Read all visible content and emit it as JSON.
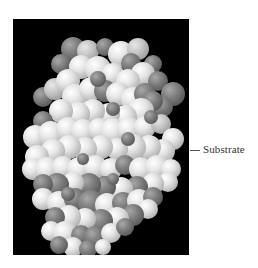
{
  "figure": {
    "label": "Substrate",
    "background": "#000000",
    "light_atom_color": "#e6e6e6",
    "dark_atom_color": "#6e6e6e"
  },
  "atoms": [
    [
      60,
      30,
      12,
      "d"
    ],
    [
      75,
      32,
      11,
      "m"
    ],
    [
      92,
      28,
      9,
      "d"
    ],
    [
      108,
      35,
      13,
      "l"
    ],
    [
      125,
      30,
      11,
      "m"
    ],
    [
      118,
      44,
      10,
      "d"
    ],
    [
      140,
      45,
      9,
      "d"
    ],
    [
      130,
      55,
      12,
      "l"
    ],
    [
      48,
      45,
      10,
      "d"
    ],
    [
      68,
      48,
      12,
      "l"
    ],
    [
      85,
      50,
      13,
      "l"
    ],
    [
      100,
      55,
      11,
      "l"
    ],
    [
      115,
      62,
      12,
      "l"
    ],
    [
      145,
      62,
      10,
      "d"
    ],
    [
      160,
      75,
      12,
      "d"
    ],
    [
      150,
      88,
      10,
      "d"
    ],
    [
      30,
      78,
      10,
      "d"
    ],
    [
      42,
      70,
      11,
      "m"
    ],
    [
      55,
      62,
      12,
      "l"
    ],
    [
      62,
      78,
      13,
      "l"
    ],
    [
      78,
      70,
      12,
      "l"
    ],
    [
      92,
      72,
      11,
      "d"
    ],
    [
      105,
      75,
      12,
      "l"
    ],
    [
      120,
      80,
      12,
      "l"
    ],
    [
      132,
      75,
      11,
      "d"
    ],
    [
      140,
      82,
      10,
      "d"
    ],
    [
      128,
      92,
      13,
      "l"
    ],
    [
      112,
      98,
      12,
      "l"
    ],
    [
      96,
      95,
      11,
      "l"
    ],
    [
      80,
      92,
      12,
      "l"
    ],
    [
      65,
      95,
      12,
      "l"
    ],
    [
      48,
      92,
      12,
      "l"
    ],
    [
      30,
      102,
      10,
      "d"
    ],
    [
      22,
      118,
      12,
      "l"
    ],
    [
      38,
      115,
      13,
      "l"
    ],
    [
      55,
      110,
      12,
      "l"
    ],
    [
      70,
      112,
      12,
      "l"
    ],
    [
      86,
      110,
      11,
      "l"
    ],
    [
      100,
      112,
      13,
      "l"
    ],
    [
      116,
      110,
      12,
      "l"
    ],
    [
      132,
      108,
      11,
      "l"
    ],
    [
      148,
      105,
      10,
      "m"
    ],
    [
      160,
      120,
      11,
      "l"
    ],
    [
      150,
      132,
      12,
      "l"
    ],
    [
      136,
      128,
      12,
      "l"
    ],
    [
      120,
      128,
      13,
      "l"
    ],
    [
      104,
      130,
      11,
      "l"
    ],
    [
      88,
      128,
      12,
      "l"
    ],
    [
      72,
      130,
      12,
      "l"
    ],
    [
      56,
      128,
      12,
      "l"
    ],
    [
      40,
      132,
      12,
      "l"
    ],
    [
      24,
      138,
      12,
      "l"
    ],
    [
      20,
      150,
      11,
      "l"
    ],
    [
      34,
      150,
      12,
      "l"
    ],
    [
      50,
      148,
      11,
      "l"
    ],
    [
      66,
      150,
      12,
      "l"
    ],
    [
      82,
      148,
      12,
      "l"
    ],
    [
      98,
      150,
      11,
      "l"
    ],
    [
      112,
      146,
      10,
      "d"
    ],
    [
      128,
      150,
      12,
      "l"
    ],
    [
      144,
      148,
      12,
      "l"
    ],
    [
      158,
      150,
      10,
      "l"
    ],
    [
      155,
      163,
      10,
      "l"
    ],
    [
      140,
      165,
      11,
      "l"
    ],
    [
      124,
      168,
      11,
      "d"
    ],
    [
      108,
      170,
      12,
      "l"
    ],
    [
      92,
      168,
      11,
      "d"
    ],
    [
      76,
      166,
      12,
      "d"
    ],
    [
      60,
      164,
      11,
      "l"
    ],
    [
      44,
      166,
      12,
      "d"
    ],
    [
      30,
      165,
      10,
      "d"
    ],
    [
      30,
      180,
      11,
      "l"
    ],
    [
      46,
      184,
      12,
      "l"
    ],
    [
      62,
      180,
      11,
      "d"
    ],
    [
      78,
      184,
      13,
      "d"
    ],
    [
      94,
      186,
      12,
      "l"
    ],
    [
      110,
      184,
      11,
      "d"
    ],
    [
      126,
      182,
      12,
      "l"
    ],
    [
      140,
      178,
      10,
      "d"
    ],
    [
      135,
      190,
      10,
      "l"
    ],
    [
      120,
      196,
      11,
      "d"
    ],
    [
      104,
      200,
      12,
      "l"
    ],
    [
      88,
      202,
      12,
      "d"
    ],
    [
      72,
      200,
      11,
      "l"
    ],
    [
      56,
      198,
      12,
      "l"
    ],
    [
      42,
      198,
      10,
      "d"
    ],
    [
      38,
      212,
      10,
      "l"
    ],
    [
      52,
      214,
      12,
      "l"
    ],
    [
      68,
      216,
      10,
      "d"
    ],
    [
      82,
      218,
      11,
      "d"
    ],
    [
      98,
      214,
      10,
      "l"
    ],
    [
      112,
      208,
      9,
      "d"
    ],
    [
      60,
      228,
      10,
      "l"
    ],
    [
      46,
      226,
      9,
      "d"
    ],
    [
      75,
      230,
      9,
      "d"
    ],
    [
      90,
      228,
      8,
      "l"
    ],
    [
      100,
      90,
      7,
      "d"
    ],
    [
      70,
      140,
      6,
      "d"
    ],
    [
      115,
      120,
      7,
      "d"
    ],
    [
      55,
      175,
      7,
      "d"
    ],
    [
      100,
      160,
      6,
      "d"
    ],
    [
      85,
      60,
      8,
      "d"
    ],
    [
      138,
      98,
      7,
      "d"
    ]
  ]
}
